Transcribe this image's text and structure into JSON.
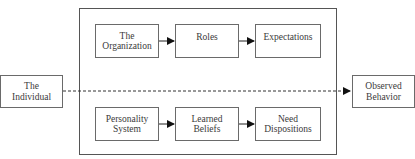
{
  "diagram": {
    "left_input": {
      "label": "The\nIndividual"
    },
    "right_output": {
      "label": "Observed\nBehavior"
    },
    "top_row": [
      {
        "label": "The\nOrganization"
      },
      {
        "label": "Roles"
      },
      {
        "label": "Expectations"
      }
    ],
    "bottom_row": [
      {
        "label": "Personality\nSystem"
      },
      {
        "label": "Learned\nBeliefs"
      },
      {
        "label": "Need\nDispositions"
      }
    ],
    "connector": {
      "style": "dashed",
      "from": "The Individual",
      "to": "Observed Behavior"
    }
  }
}
